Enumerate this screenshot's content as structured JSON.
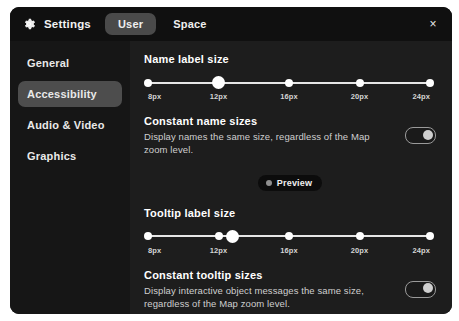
{
  "header": {
    "gear_icon": "gear-icon",
    "title": "Settings",
    "tabs": [
      {
        "label": "User",
        "active": true
      },
      {
        "label": "Space",
        "active": false
      }
    ],
    "close_icon": "×"
  },
  "sidebar": {
    "items": [
      {
        "label": "General",
        "active": false
      },
      {
        "label": "Accessibility",
        "active": true
      },
      {
        "label": "Audio & Video",
        "active": false
      },
      {
        "label": "Graphics",
        "active": false
      }
    ]
  },
  "main": {
    "name_label_size": {
      "title": "Name label size",
      "ticks": [
        "8px",
        "12px",
        "16px",
        "20px",
        "24px"
      ],
      "value": "12px",
      "thumb_percent": 25
    },
    "constant_name_sizes": {
      "label": "Constant name sizes",
      "description": "Display names the same size, regardless of the Map zoom level.",
      "toggle_on": true
    },
    "preview": {
      "icon": "preview-dot-icon",
      "label": "Preview"
    },
    "tooltip_label_size": {
      "title": "Tooltip label size",
      "ticks": [
        "8px",
        "12px",
        "16px",
        "20px",
        "24px"
      ],
      "value": "13px",
      "thumb_percent": 30
    },
    "constant_tooltip_sizes": {
      "label": "Constant tooltip sizes",
      "description": "Display interactive object messages the same size, regardless of the Map zoom level.",
      "toggle_on": true
    }
  },
  "colors": {
    "panel_bg": "#141414",
    "sidebar_bg": "#161616",
    "content_bg": "#1d1d1d",
    "active_pill": "#4d4d4d",
    "slider": "#ffffff",
    "text": "#ffffff"
  }
}
